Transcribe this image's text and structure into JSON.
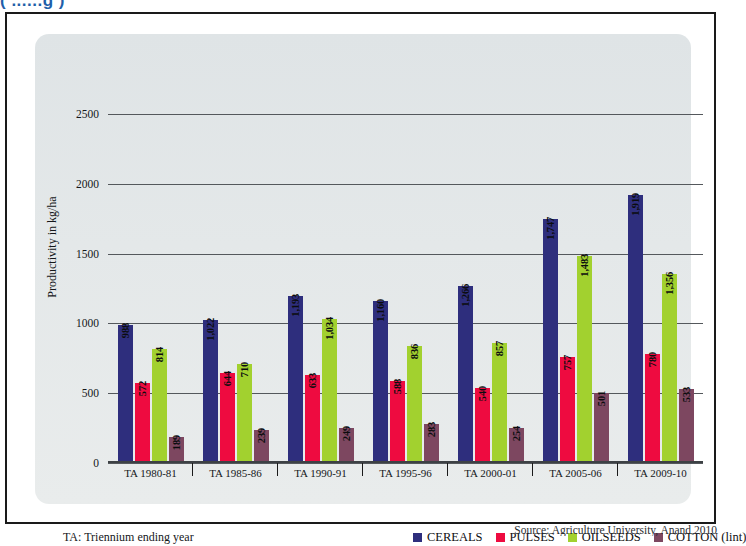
{
  "page": {
    "top_title_partial": "(  ......g                                    )",
    "source_note": "Source: Agriculture University, Anand 2010"
  },
  "chart_data": {
    "type": "bar",
    "title": "",
    "xlabel": "",
    "ylabel": "Productivity in kg/ha",
    "ylim": [
      0,
      2700
    ],
    "yticks": [
      0,
      500,
      1000,
      1500,
      2000,
      2500
    ],
    "ytick_labels": [
      "0",
      "500",
      "1000",
      "1500",
      "2000",
      "2500"
    ],
    "grid": true,
    "legend_position": "bottom-right",
    "categories": [
      "TA 1980-81",
      "TA 1985-86",
      "TA 1990-91",
      "TA 1995-96",
      "TA 2000-01",
      "TA 2005-06",
      "TA 2009-10"
    ],
    "series": [
      {
        "name": "CEREALS",
        "color": "#2e2e7d",
        "values": [
          988,
          1022,
          1193,
          1160,
          1266,
          1747,
          1919
        ],
        "labels": [
          "988",
          "1,022",
          "1,193",
          "1,160",
          "1,266",
          "1,747",
          "1,919"
        ]
      },
      {
        "name": "PULSES",
        "color": "#ee0b40",
        "values": [
          572,
          644,
          633,
          588,
          540,
          757,
          780
        ],
        "labels": [
          "572",
          "644",
          "633",
          "588",
          "540",
          "757",
          "780"
        ]
      },
      {
        "name": "OILSEEDS",
        "color": "#a2d12f",
        "values": [
          814,
          710,
          1034,
          836,
          857,
          1483,
          1356
        ],
        "labels": [
          "814",
          "710",
          "1,034",
          "836",
          "857",
          "1,483",
          "1,356"
        ]
      },
      {
        "name": "COTTON (lint)",
        "color": "#7d4760",
        "values": [
          189,
          239,
          249,
          283,
          254,
          501,
          533
        ],
        "labels": [
          "189",
          "239",
          "249",
          "283",
          "254",
          "501",
          "533"
        ]
      }
    ]
  },
  "footer": {
    "ta_note": "TA: Triennium ending year"
  }
}
